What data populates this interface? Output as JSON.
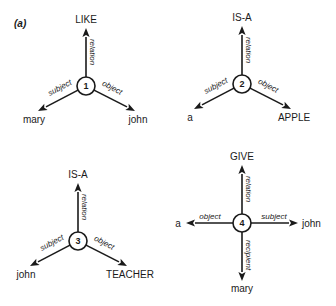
{
  "panel_label": "(a)",
  "colors": {
    "ink": "#1a1a1a",
    "background": "#ffffff"
  },
  "graphs": [
    {
      "id": "1",
      "edges": [
        {
          "label": "relation",
          "target": "LIKE",
          "direction": "up"
        },
        {
          "label": "subject",
          "target": "mary",
          "direction": "down-left"
        },
        {
          "label": "object",
          "target": "john",
          "direction": "down-right"
        }
      ]
    },
    {
      "id": "2",
      "edges": [
        {
          "label": "relation",
          "target": "IS-A",
          "direction": "up"
        },
        {
          "label": "subject",
          "target": "a",
          "direction": "down-left"
        },
        {
          "label": "object",
          "target": "APPLE",
          "direction": "down-right"
        }
      ]
    },
    {
      "id": "3",
      "edges": [
        {
          "label": "relation",
          "target": "IS-A",
          "direction": "up"
        },
        {
          "label": "subject",
          "target": "john",
          "direction": "down-left"
        },
        {
          "label": "object",
          "target": "TEACHER",
          "direction": "down-right"
        }
      ]
    },
    {
      "id": "4",
      "edges": [
        {
          "label": "relation",
          "target": "GIVE",
          "direction": "up"
        },
        {
          "label": "object",
          "target": "a",
          "direction": "left"
        },
        {
          "label": "subject",
          "target": "john",
          "direction": "right"
        },
        {
          "label": "recipient",
          "target": "mary",
          "direction": "down"
        }
      ]
    }
  ]
}
